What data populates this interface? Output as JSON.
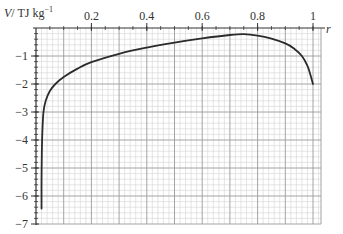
{
  "chart_data": {
    "type": "line",
    "title": "",
    "xlabel": "r",
    "ylabel": "V / TJ kg⁻¹",
    "ylabel_parts": {
      "italic": "V",
      "rest": "/ TJ kg",
      "sup": "−1"
    },
    "xlim": [
      0,
      1
    ],
    "ylim": [
      -7,
      0
    ],
    "x_ticks": [
      {
        "value": 0.2,
        "label": "0.2"
      },
      {
        "value": 0.4,
        "label": "0.4"
      },
      {
        "value": 0.6,
        "label": "0.6"
      },
      {
        "value": 0.8,
        "label": "0.8"
      },
      {
        "value": 1.0,
        "label": "1"
      }
    ],
    "y_ticks": [
      {
        "value": -1,
        "label": "−1"
      },
      {
        "value": -2,
        "label": "−2"
      },
      {
        "value": -3,
        "label": "−3"
      },
      {
        "value": -4,
        "label": "−4"
      },
      {
        "value": -5,
        "label": "−5"
      },
      {
        "value": -6,
        "label": "−6"
      },
      {
        "value": -7,
        "label": "−7"
      }
    ],
    "x_axis_position": "top",
    "grid": true,
    "legend": null,
    "series": [
      {
        "name": "V(r)",
        "color": "#2b2b2b",
        "x": [
          0.02,
          0.02,
          0.021,
          0.023,
          0.027,
          0.035,
          0.05,
          0.07,
          0.1,
          0.15,
          0.2,
          0.3,
          0.4,
          0.5,
          0.6,
          0.7,
          0.75,
          0.8,
          0.85,
          0.9,
          0.93,
          0.96,
          0.98,
          0.99,
          1.0
        ],
        "y": [
          -6.45,
          -5.5,
          -4.5,
          -3.7,
          -3.0,
          -2.6,
          -2.25,
          -2.0,
          -1.75,
          -1.45,
          -1.22,
          -0.92,
          -0.7,
          -0.52,
          -0.37,
          -0.25,
          -0.22,
          -0.27,
          -0.38,
          -0.55,
          -0.72,
          -1.0,
          -1.35,
          -1.65,
          -2.0
        ]
      }
    ]
  }
}
